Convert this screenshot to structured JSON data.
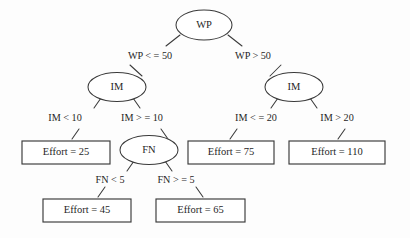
{
  "diagram": {
    "type": "decision-tree",
    "background_color": "#fdfdfd",
    "stroke_color": "#3a3a3a",
    "text_color": "#1f1f1f",
    "decision_nodes": [
      {
        "id": "root",
        "label": "WP",
        "cx": 204,
        "cy": 25,
        "rx": 28,
        "ry": 15
      },
      {
        "id": "im_left",
        "label": "IM",
        "cx": 117,
        "cy": 87,
        "rx": 29,
        "ry": 14.5
      },
      {
        "id": "im_right",
        "label": "IM",
        "cx": 294,
        "cy": 87,
        "rx": 29,
        "ry": 14.5
      },
      {
        "id": "fn",
        "label": "FN",
        "cx": 149,
        "cy": 150,
        "rx": 29,
        "ry": 14.5
      }
    ],
    "leaf_nodes": [
      {
        "id": "leaf25",
        "label": "Effort = 25",
        "x": 22,
        "y": 141,
        "w": 88,
        "h": 23
      },
      {
        "id": "leaf75",
        "label": "Effort = 75",
        "x": 188,
        "y": 141,
        "w": 86,
        "h": 23
      },
      {
        "id": "leaf110",
        "label": "Effort = 110",
        "x": 289,
        "y": 141,
        "w": 96,
        "h": 23
      },
      {
        "id": "leaf45",
        "label": "Effort = 45",
        "x": 43,
        "y": 199,
        "w": 88,
        "h": 23
      },
      {
        "id": "leaf65",
        "label": "Effort = 65",
        "x": 156,
        "y": 199,
        "w": 89,
        "h": 23
      }
    ],
    "edge_labels": [
      {
        "id": "wp_le_50",
        "text": "WP < = 50",
        "x": 150,
        "y": 57
      },
      {
        "id": "wp_gt_50",
        "text": "WP > 50",
        "x": 253,
        "y": 57
      },
      {
        "id": "im_lt_10",
        "text": "IM < 10",
        "x": 65,
        "y": 119
      },
      {
        "id": "im_ge_10",
        "text": "IM > = 10",
        "x": 142,
        "y": 119
      },
      {
        "id": "im_le_20",
        "text": "IM < = 20",
        "x": 256,
        "y": 119
      },
      {
        "id": "im_gt_20",
        "text": "IM > 20",
        "x": 337,
        "y": 119
      },
      {
        "id": "fn_lt_5",
        "text": "FN < 5",
        "x": 110,
        "y": 181
      },
      {
        "id": "fn_ge_5",
        "text": "FN > = 5",
        "x": 176,
        "y": 181
      }
    ],
    "connectors": [
      {
        "id": "root-to-left",
        "x1": 180,
        "y1": 35,
        "x2": 166,
        "y2": 46
      },
      {
        "id": "root-to-right",
        "x1": 228,
        "y1": 35,
        "x2": 242,
        "y2": 46
      },
      {
        "id": "wp-left-stub",
        "x1": 130,
        "y1": 65,
        "x2": 142,
        "y2": 76
      },
      {
        "id": "wp-right-stub",
        "x1": 281,
        "y1": 65,
        "x2": 270,
        "y2": 76
      },
      {
        "id": "imleft-to-leaf25",
        "x1": 101,
        "y1": 98,
        "x2": 94,
        "y2": 108
      },
      {
        "id": "imleft-to-fn",
        "x1": 133,
        "y1": 98,
        "x2": 140,
        "y2": 108
      },
      {
        "id": "leaf25-stub",
        "x1": 79,
        "y1": 129,
        "x2": 72,
        "y2": 139
      },
      {
        "id": "fn-stub",
        "x1": 161,
        "y1": 129,
        "x2": 168,
        "y2": 139
      },
      {
        "id": "imright-to-leaf75",
        "x1": 278,
        "y1": 98,
        "x2": 271,
        "y2": 108
      },
      {
        "id": "imright-to-leaf110",
        "x1": 310,
        "y1": 98,
        "x2": 317,
        "y2": 108
      },
      {
        "id": "leaf75-stub",
        "x1": 237,
        "y1": 129,
        "x2": 230,
        "y2": 139
      },
      {
        "id": "leaf110-stub",
        "x1": 345,
        "y1": 129,
        "x2": 338,
        "y2": 139
      },
      {
        "id": "fn-to-leaf45",
        "x1": 134,
        "y1": 161,
        "x2": 127,
        "y2": 171
      },
      {
        "id": "fn-to-leaf65",
        "x1": 165,
        "y1": 161,
        "x2": 172,
        "y2": 171
      },
      {
        "id": "leaf45-stub",
        "x1": 105,
        "y1": 187,
        "x2": 98,
        "y2": 197
      },
      {
        "id": "leaf65-stub",
        "x1": 196,
        "y1": 187,
        "x2": 203,
        "y2": 197
      }
    ]
  },
  "chart_data": {
    "type": "diagram",
    "title": "",
    "tree": {
      "node": "WP",
      "children": [
        {
          "condition": "WP < = 50",
          "node": "IM",
          "children": [
            {
              "condition": "IM < 10",
              "leaf": "Effort = 25",
              "value": 25
            },
            {
              "condition": "IM > = 10",
              "node": "FN",
              "children": [
                {
                  "condition": "FN < 5",
                  "leaf": "Effort = 45",
                  "value": 45
                },
                {
                  "condition": "FN > = 5",
                  "leaf": "Effort = 65",
                  "value": 65
                }
              ]
            }
          ]
        },
        {
          "condition": "WP > 50",
          "node": "IM",
          "children": [
            {
              "condition": "IM < = 20",
              "leaf": "Effort = 75",
              "value": 75
            },
            {
              "condition": "IM > 20",
              "leaf": "Effort = 110",
              "value": 110
            }
          ]
        }
      ]
    }
  }
}
